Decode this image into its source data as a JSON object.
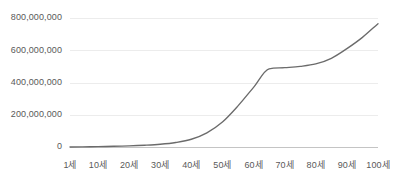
{
  "chart_data": {
    "type": "line",
    "title": "",
    "subtitle": "",
    "xlabel": "",
    "ylabel": "",
    "grid": true,
    "legend": false,
    "legend_position": "none",
    "line_color": "#6b6b6b",
    "gridline_color": "#ececec",
    "baseline_color": "#c4c4c4",
    "text_color": "#595959",
    "background_color": "#ffffff",
    "xlim": [
      1,
      100
    ],
    "ylim": [
      0,
      800000000
    ],
    "y_ticks": [
      0,
      200000000,
      400000000,
      600000000,
      800000000
    ],
    "y_tick_labels": [
      "0",
      "200,000,000",
      "400,000,000",
      "600,000,000",
      "800,000,000"
    ],
    "x_ticks": [
      1,
      10,
      20,
      30,
      40,
      50,
      60,
      70,
      80,
      90,
      100
    ],
    "x_tick_labels": [
      "1세",
      "10세",
      "20세",
      "30세",
      "40세",
      "50세",
      "60세",
      "70세",
      "80세",
      "90세",
      "100세"
    ],
    "categories": [
      1,
      5,
      10,
      15,
      20,
      25,
      30,
      35,
      40,
      45,
      50,
      55,
      60,
      65,
      70,
      75,
      80,
      85,
      90,
      95,
      100
    ],
    "series": [
      {
        "name": "누적값",
        "values": [
          0,
          1000000,
          2500000,
          4500000,
          7000000,
          11000000,
          17000000,
          28000000,
          48000000,
          88000000,
          155000000,
          255000000,
          370000000,
          485000000,
          492000000,
          500000000,
          515000000,
          550000000,
          610000000,
          680000000,
          765000000
        ]
      }
    ],
    "annotations": [
      {
        "label": "평탄 구간",
        "x_start": 65,
        "x_end": 80,
        "value": 485000000
      }
    ]
  },
  "plot_geometry": {
    "left": 70,
    "right": 378,
    "top": 18,
    "bottom": 147,
    "x_label_y": 162
  }
}
